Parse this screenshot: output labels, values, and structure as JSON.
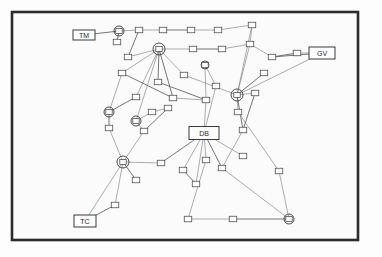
{
  "figure": {
    "background_color": "#fdfdfd",
    "frame_color": "#2b2b2b",
    "edge_color": "#8a8a8a"
  },
  "labels": {
    "top_left": "TM",
    "right": "GV",
    "bottom_left": "TC",
    "center": "DB"
  },
  "graph_data": {
    "type": "node-link-diagram",
    "frame": {
      "x": 12,
      "y": 12,
      "width": 346,
      "height": 228
    },
    "labeled_nodes": [
      {
        "id": "TM",
        "label": "TM",
        "x": 84,
        "y": 35,
        "w": 22,
        "h": 10,
        "kind": "label-box"
      },
      {
        "id": "GV",
        "label": "GV",
        "x": 322,
        "y": 53,
        "w": 26,
        "h": 12,
        "kind": "label-box"
      },
      {
        "id": "TC",
        "label": "TC",
        "x": 85,
        "y": 221,
        "w": 22,
        "h": 12,
        "kind": "label-box"
      },
      {
        "id": "DB",
        "label": "DB",
        "x": 204,
        "y": 133,
        "w": 30,
        "h": 13,
        "kind": "label-box"
      }
    ],
    "hub_nodes": [
      {
        "id": "h1",
        "x": 119,
        "y": 31,
        "r": 5
      },
      {
        "id": "h2",
        "x": 159,
        "y": 49,
        "r": 6
      },
      {
        "id": "h3",
        "x": 237,
        "y": 95,
        "r": 6
      },
      {
        "id": "h4",
        "x": 123,
        "y": 162,
        "r": 6
      },
      {
        "id": "h5",
        "x": 109,
        "y": 112,
        "r": 5
      },
      {
        "id": "h6",
        "x": 136,
        "y": 121,
        "r": 5
      },
      {
        "id": "h7",
        "x": 289,
        "y": 219,
        "r": 5
      },
      {
        "id": "h8",
        "x": 205,
        "y": 65,
        "r": 4
      }
    ],
    "box_nodes": [
      {
        "id": "b1",
        "x": 139,
        "y": 30
      },
      {
        "id": "b2",
        "x": 163,
        "y": 30
      },
      {
        "id": "b3",
        "x": 191,
        "y": 30
      },
      {
        "id": "b4",
        "x": 218,
        "y": 30
      },
      {
        "id": "b5",
        "x": 252,
        "y": 25
      },
      {
        "id": "b6",
        "x": 128,
        "y": 57
      },
      {
        "id": "b7",
        "x": 193,
        "y": 49
      },
      {
        "id": "b8",
        "x": 222,
        "y": 49
      },
      {
        "id": "b9",
        "x": 250,
        "y": 44
      },
      {
        "id": "b10",
        "x": 272,
        "y": 57
      },
      {
        "id": "b11",
        "x": 297,
        "y": 53
      },
      {
        "id": "b12",
        "x": 122,
        "y": 73
      },
      {
        "id": "b13",
        "x": 158,
        "y": 82
      },
      {
        "id": "b14",
        "x": 184,
        "y": 75
      },
      {
        "id": "b15",
        "x": 264,
        "y": 73
      },
      {
        "id": "b16",
        "x": 216,
        "y": 86
      },
      {
        "id": "b17",
        "x": 255,
        "y": 93
      },
      {
        "id": "b18",
        "x": 136,
        "y": 97
      },
      {
        "id": "b19",
        "x": 173,
        "y": 98
      },
      {
        "id": "b20",
        "x": 206,
        "y": 100
      },
      {
        "id": "b21",
        "x": 109,
        "y": 128
      },
      {
        "id": "b22",
        "x": 152,
        "y": 112
      },
      {
        "id": "b23",
        "x": 168,
        "y": 108
      },
      {
        "id": "b24",
        "x": 144,
        "y": 131
      },
      {
        "id": "b25",
        "x": 238,
        "y": 112
      },
      {
        "id": "b26",
        "x": 243,
        "y": 130
      },
      {
        "id": "b27",
        "x": 161,
        "y": 163
      },
      {
        "id": "b28",
        "x": 206,
        "y": 160
      },
      {
        "id": "b29",
        "x": 136,
        "y": 180
      },
      {
        "id": "b30",
        "x": 183,
        "y": 170
      },
      {
        "id": "b31",
        "x": 222,
        "y": 168
      },
      {
        "id": "b32",
        "x": 243,
        "y": 156
      },
      {
        "id": "b33",
        "x": 196,
        "y": 184
      },
      {
        "id": "b34",
        "x": 188,
        "y": 219
      },
      {
        "id": "b35",
        "x": 233,
        "y": 219
      },
      {
        "id": "b36",
        "x": 115,
        "y": 205
      },
      {
        "id": "b37",
        "x": 117,
        "y": 42
      },
      {
        "id": "b38",
        "x": 279,
        "y": 171
      }
    ],
    "edges": [
      [
        "TM",
        "h1"
      ],
      [
        "h1",
        "b1"
      ],
      [
        "b1",
        "b2"
      ],
      [
        "b2",
        "b3"
      ],
      [
        "b3",
        "b4"
      ],
      [
        "b4",
        "b5"
      ],
      [
        "b1",
        "b6"
      ],
      [
        "b6",
        "h2"
      ],
      [
        "h2",
        "b7"
      ],
      [
        "b7",
        "b8"
      ],
      [
        "b8",
        "b9"
      ],
      [
        "b9",
        "b10"
      ],
      [
        "b10",
        "GV"
      ],
      [
        "b5",
        "b9"
      ],
      [
        "h2",
        "b12"
      ],
      [
        "h2",
        "b13"
      ],
      [
        "h2",
        "b14"
      ],
      [
        "h2",
        "b18"
      ],
      [
        "h2",
        "b19"
      ],
      [
        "h2",
        "h6"
      ],
      [
        "b14",
        "h3"
      ],
      [
        "h3",
        "b15"
      ],
      [
        "h3",
        "b17"
      ],
      [
        "h3",
        "b25"
      ],
      [
        "h3",
        "b26"
      ],
      [
        "b9",
        "h3"
      ],
      [
        "h3",
        "GV"
      ],
      [
        "b12",
        "b19"
      ],
      [
        "b19",
        "b20"
      ],
      [
        "b20",
        "DB"
      ],
      [
        "h5",
        "b21"
      ],
      [
        "b21",
        "h4"
      ],
      [
        "h4",
        "b27"
      ],
      [
        "h4",
        "b29"
      ],
      [
        "h4",
        "TC"
      ],
      [
        "b22",
        "b23"
      ],
      [
        "b23",
        "b24"
      ],
      [
        "b24",
        "h4"
      ],
      [
        "h6",
        "b22"
      ],
      [
        "b27",
        "DB"
      ],
      [
        "DB",
        "b28"
      ],
      [
        "DB",
        "b30"
      ],
      [
        "DB",
        "b31"
      ],
      [
        "DB",
        "b32"
      ],
      [
        "DB",
        "b33"
      ],
      [
        "b30",
        "b33"
      ],
      [
        "b28",
        "b34"
      ],
      [
        "b34",
        "b35"
      ],
      [
        "b35",
        "h7"
      ],
      [
        "b31",
        "h7"
      ],
      [
        "b38",
        "h7"
      ],
      [
        "TC",
        "b36"
      ],
      [
        "b36",
        "h4"
      ],
      [
        "b16",
        "DB"
      ],
      [
        "b13",
        "b20"
      ],
      [
        "h8",
        "b20"
      ],
      [
        "h8",
        "b16"
      ],
      [
        "b37",
        "h1"
      ],
      [
        "b25",
        "b38"
      ],
      [
        "b5",
        "h3"
      ],
      [
        "b18",
        "h5"
      ],
      [
        "b12",
        "h5"
      ],
      [
        "h6",
        "b24"
      ],
      [
        "b17",
        "b26"
      ],
      [
        "b26",
        "b31"
      ],
      [
        "b11",
        "GV"
      ],
      [
        "b10",
        "b11"
      ]
    ]
  }
}
